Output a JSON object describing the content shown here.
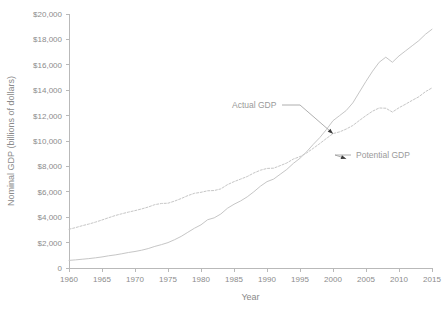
{
  "chart_data": {
    "type": "line",
    "title": "",
    "xlabel": "Year",
    "ylabel": "Nominal GDP (billions of dollars)",
    "xlim": [
      1960,
      2015
    ],
    "ylim": [
      0,
      20000
    ],
    "grid": false,
    "legend_position": "inline-annotations",
    "x_ticks": [
      1960,
      1965,
      1970,
      1975,
      1980,
      1985,
      1990,
      1995,
      2000,
      2005,
      2010,
      2015
    ],
    "x_tick_labels": [
      "1960",
      "1965",
      "1970",
      "1975",
      "1980",
      "1985",
      "1990",
      "1995",
      "2000",
      "2005",
      "2010",
      "2015"
    ],
    "y_ticks": [
      0,
      2000,
      4000,
      6000,
      8000,
      10000,
      12000,
      14000,
      16000,
      18000,
      20000
    ],
    "y_tick_labels": [
      "0",
      "$2,000",
      "$4,000",
      "$6,000",
      "$8,000",
      "$10,000",
      "$12,000",
      "$14,000",
      "$16,000",
      "$18,000",
      "$20,000"
    ],
    "x": [
      1960,
      1961,
      1962,
      1963,
      1964,
      1965,
      1966,
      1967,
      1968,
      1969,
      1970,
      1971,
      1972,
      1973,
      1974,
      1975,
      1976,
      1977,
      1978,
      1979,
      1980,
      1981,
      1982,
      1983,
      1984,
      1985,
      1986,
      1987,
      1988,
      1989,
      1990,
      1991,
      1992,
      1993,
      1994,
      1995,
      1996,
      1997,
      1998,
      1999,
      2000,
      2001,
      2002,
      2003,
      2004,
      2005,
      2006,
      2007,
      2008,
      2009,
      2010,
      2011,
      2012,
      2013,
      2014,
      2015
    ],
    "series": [
      {
        "name": "Actual GDP",
        "style": "dashed",
        "color": "#c6c6c6",
        "values": [
          3050,
          3180,
          3330,
          3460,
          3610,
          3780,
          3960,
          4130,
          4270,
          4400,
          4520,
          4650,
          4800,
          4990,
          5080,
          5100,
          5270,
          5470,
          5700,
          5880,
          5960,
          6080,
          6100,
          6230,
          6560,
          6800,
          7000,
          7200,
          7480,
          7700,
          7840,
          7860,
          8060,
          8270,
          8580,
          8770,
          9060,
          9420,
          9800,
          10200,
          10580,
          10720,
          10940,
          11220,
          11620,
          12000,
          12350,
          12600,
          12580,
          12280,
          12620,
          12900,
          13200,
          13480,
          13880,
          14180
        ],
        "note": "upper curve for most of period; plateau/dip near 2008-2010"
      },
      {
        "name": "Potential GDP",
        "style": "solid",
        "color": "#c6c6c6",
        "values": [
          600,
          640,
          690,
          740,
          800,
          870,
          960,
          1030,
          1120,
          1220,
          1300,
          1400,
          1530,
          1700,
          1840,
          2000,
          2230,
          2490,
          2810,
          3130,
          3400,
          3800,
          3950,
          4250,
          4700,
          5020,
          5280,
          5600,
          6000,
          6440,
          6800,
          7000,
          7380,
          7760,
          8240,
          8640,
          9150,
          9730,
          10270,
          10900,
          11600,
          12000,
          12400,
          13000,
          13850,
          14700,
          15500,
          16200,
          16600,
          16200,
          16700,
          17100,
          17500,
          17900,
          18400,
          18800
        ],
        "note": "lower curve early; crosses above the dashed curve around 2008"
      }
    ],
    "annotations": [
      {
        "text": "Actual GDP",
        "target_year": 2000,
        "target_value": 10580,
        "label_x": 232,
        "label_y": 108
      },
      {
        "text": "Potential GDP",
        "target_year": 2002,
        "target_value": 8600,
        "label_x": 356,
        "label_y": 158
      }
    ]
  }
}
